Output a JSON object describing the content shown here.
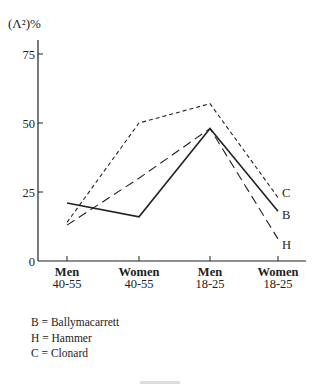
{
  "chart_data": {
    "type": "line",
    "title": "",
    "ylabel": "(Λ²)%",
    "xlabel": "",
    "ylim": [
      0,
      80
    ],
    "yticks": [
      0,
      25,
      50,
      75
    ],
    "grid": false,
    "categories": [
      [
        "Men",
        "40-55"
      ],
      [
        "Women",
        "40-55"
      ],
      [
        "Men",
        "18-25"
      ],
      [
        "Women",
        "18-25"
      ]
    ],
    "series": [
      {
        "name": "B",
        "label": "Ballymacarrett",
        "style": "solid",
        "values": [
          21,
          16,
          48,
          18
        ]
      },
      {
        "name": "H",
        "label": "Hammer",
        "style": "long-dash",
        "values": [
          13,
          30,
          48,
          8
        ]
      },
      {
        "name": "C",
        "label": "Clonard",
        "style": "short-dash",
        "values": [
          14,
          50,
          57,
          23
        ]
      }
    ],
    "legend_position": "bottom-left",
    "end_labels": [
      "C",
      "B",
      "H"
    ]
  },
  "legend": {
    "rows": [
      "B = Ballymacarrett",
      "H = Hammer",
      "C = Clonard"
    ]
  },
  "colors": {
    "ink": "#222222",
    "background": "#ffffff"
  }
}
